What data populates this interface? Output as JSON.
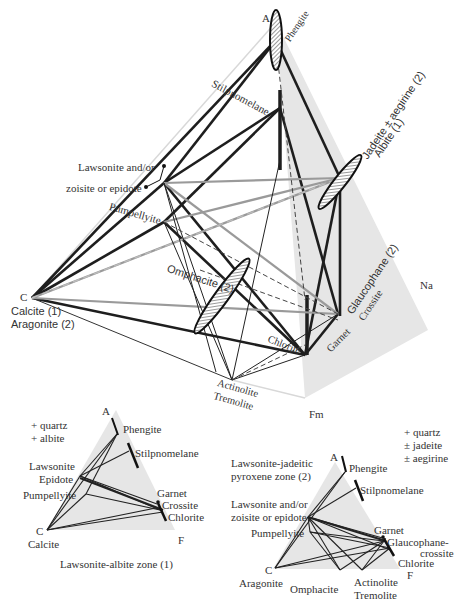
{
  "main_tetrahedron": {
    "vertices": {
      "A": "A",
      "C": "C",
      "Fm": "Fm",
      "Na": "Na"
    },
    "labels": {
      "phengite": "Phengite",
      "stilpnomelane": "Stilpnomelane",
      "lawsonite_line1": "Lawsonite and/or",
      "lawsonite_line2": "zoisite or epidote",
      "pumpellyite": "Pumpellyite",
      "jadeite": "Jadeite ± aegirine (2)",
      "albite": "Albite (1)",
      "omphacite": "Omphacite (2)",
      "calcite": "Calcite (1)",
      "aragonite": "Aragonite (2)",
      "glaucophane": "Glaucophane (2)",
      "crossite": "Crossite",
      "chlorite": "Chlorite",
      "garnet": "Garnet",
      "actinolite": "Actinolite",
      "tremolite": "Tremolite"
    }
  },
  "diagram_1": {
    "vertices": {
      "A": "A",
      "C": "C",
      "F": "F"
    },
    "assemblage": [
      "+ quartz",
      "+ albite"
    ],
    "labels": {
      "phengite": "Phengite",
      "stilpnomelane": "Stilpnomelane",
      "lawsonite": "Lawsonite",
      "epidote": "Epidote",
      "pumpellyite": "Pumpellyite",
      "garnet": "Garnet",
      "crossite": "Crossite",
      "chlorite": "Chlorite",
      "calcite": "Calcite"
    },
    "caption": "Lawsonite-albite zone (1)"
  },
  "diagram_2": {
    "vertices": {
      "A": "A",
      "C": "C",
      "F": "F"
    },
    "assemblage": [
      "+ quartz",
      "± jadeite",
      "± aegirine"
    ],
    "caption_line1": "Lawsonite-jadeitic",
    "caption_line2": "pyroxene zone (2)",
    "labels": {
      "phengite": "Phengite",
      "stilpnomelane": "Stilpnomelane",
      "lawsonite_line1": "Lawsonite and/or",
      "lawsonite_line2": "zoisite or epidote",
      "pumpellyite": "Pumpellyite",
      "garnet": "Garnet",
      "glaucophane_line1": "Glaucophane-",
      "glaucophane_line2": "crossite",
      "chlorite": "Chlorite",
      "aragonite": "Aragonite",
      "omphacite": "Omphacite",
      "actinolite": "Actinolite",
      "tremolite": "Tremolite"
    }
  },
  "colors": {
    "face_shade": "#e6e6e6",
    "line_dark": "#1e1e1e",
    "line_gray": "#9a9a9a",
    "line_light": "#d8d8d8"
  }
}
